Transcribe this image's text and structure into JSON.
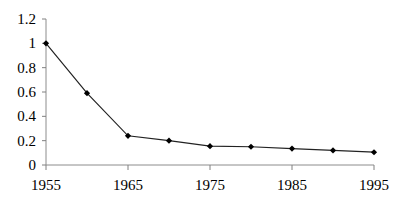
{
  "chart_data": {
    "type": "line",
    "title": "",
    "subtitle": "",
    "xlabel": "",
    "ylabel": "",
    "x": [
      1955,
      1960,
      1965,
      1970,
      1975,
      1980,
      1985,
      1990,
      1995
    ],
    "values": [
      1.0,
      0.59,
      0.24,
      0.2,
      0.155,
      0.15,
      0.135,
      0.12,
      0.105
    ],
    "series": [
      {
        "name": "",
        "values": [
          1.0,
          0.59,
          0.24,
          0.2,
          0.155,
          0.15,
          0.135,
          0.12,
          0.105
        ]
      }
    ],
    "xlim": [
      1955,
      1995
    ],
    "ylim": [
      0,
      1.2
    ],
    "y_ticks": [
      0,
      0.2,
      0.4,
      0.6,
      0.8,
      1,
      1.2
    ],
    "y_tick_labels": [
      "0",
      "0.2",
      "0.4",
      "0.6",
      "0.8",
      "1",
      "1.2"
    ],
    "x_ticks": [
      1955,
      1965,
      1975,
      1985,
      1995
    ],
    "x_tick_labels": [
      "1955",
      "1965",
      "1975",
      "1985",
      "1995"
    ],
    "grid": false,
    "legend": false,
    "legend_position": "none",
    "marker": "filled-diamond",
    "line_color": "#222222",
    "marker_color": "#000000",
    "axis_color": "#808080",
    "background_color": "#ffffff",
    "annotations": []
  }
}
